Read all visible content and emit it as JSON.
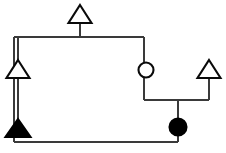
{
  "diagram": {
    "type": "pedigree",
    "canvas": {
      "width": 226,
      "height": 153,
      "background": "#ffffff"
    },
    "colors": {
      "symbol_stroke": "#0a0a0a",
      "symbol_unaffected_fill": "#ffffff",
      "symbol_affected_fill": "#000000",
      "line_stroke": "#3a3a3a"
    },
    "symbols": [
      {
        "id": "top-male",
        "shape": "triangle",
        "sex": "male",
        "status": "unaffected",
        "fill": "#ffffff",
        "cx": 80,
        "cy": 14,
        "width": 23,
        "height": 18
      },
      {
        "id": "left-male",
        "shape": "triangle",
        "sex": "male",
        "status": "unaffected",
        "fill": "#ffffff",
        "cx": 18,
        "cy": 69,
        "width": 23,
        "height": 18
      },
      {
        "id": "middle-female",
        "shape": "circle",
        "sex": "female",
        "status": "unaffected",
        "fill": "#ffffff",
        "cx": 146,
        "cy": 70,
        "radius": 7.5
      },
      {
        "id": "right-male",
        "shape": "triangle",
        "sex": "male",
        "status": "unaffected",
        "fill": "#ffffff",
        "cx": 209,
        "cy": 69,
        "width": 23,
        "height": 18
      },
      {
        "id": "bottom-left-male-affected",
        "shape": "triangle",
        "sex": "male",
        "status": "affected",
        "fill": "#000000",
        "cx": 18,
        "cy": 128,
        "width": 25,
        "height": 18
      },
      {
        "id": "bottom-right-female-affected",
        "shape": "circle",
        "sex": "female",
        "status": "affected",
        "fill": "#000000",
        "cx": 178,
        "cy": 127,
        "radius": 8.5
      }
    ],
    "connectors": [
      {
        "id": "top-male-descender",
        "from_x": 80,
        "from_y": 22,
        "to_x": 80,
        "to_y": 37
      },
      {
        "id": "upper-sibship-bar",
        "from_x": 14,
        "from_y": 37,
        "to_x": 144,
        "to_y": 37
      },
      {
        "id": "left-branch-descender",
        "from_x": 14,
        "from_y": 37,
        "to_x": 14,
        "to_y": 142
      },
      {
        "id": "right-branch-descender",
        "from_x": 144,
        "from_y": 37,
        "to_x": 144,
        "to_y": 100
      },
      {
        "id": "lower-mating-bar",
        "from_x": 144,
        "from_y": 100,
        "to_x": 209,
        "to_y": 100
      },
      {
        "id": "right-male-descender",
        "from_x": 209,
        "from_y": 78,
        "to_x": 209,
        "to_y": 100
      },
      {
        "id": "child-descender",
        "from_x": 178,
        "from_y": 100,
        "to_x": 178,
        "to_y": 134
      },
      {
        "id": "bottom-bar",
        "from_x": 14,
        "from_y": 142,
        "to_x": 178,
        "to_y": 142
      },
      {
        "id": "bottom-right-riser",
        "from_x": 178,
        "from_y": 134,
        "to_x": 178,
        "to_y": 142
      }
    ]
  }
}
